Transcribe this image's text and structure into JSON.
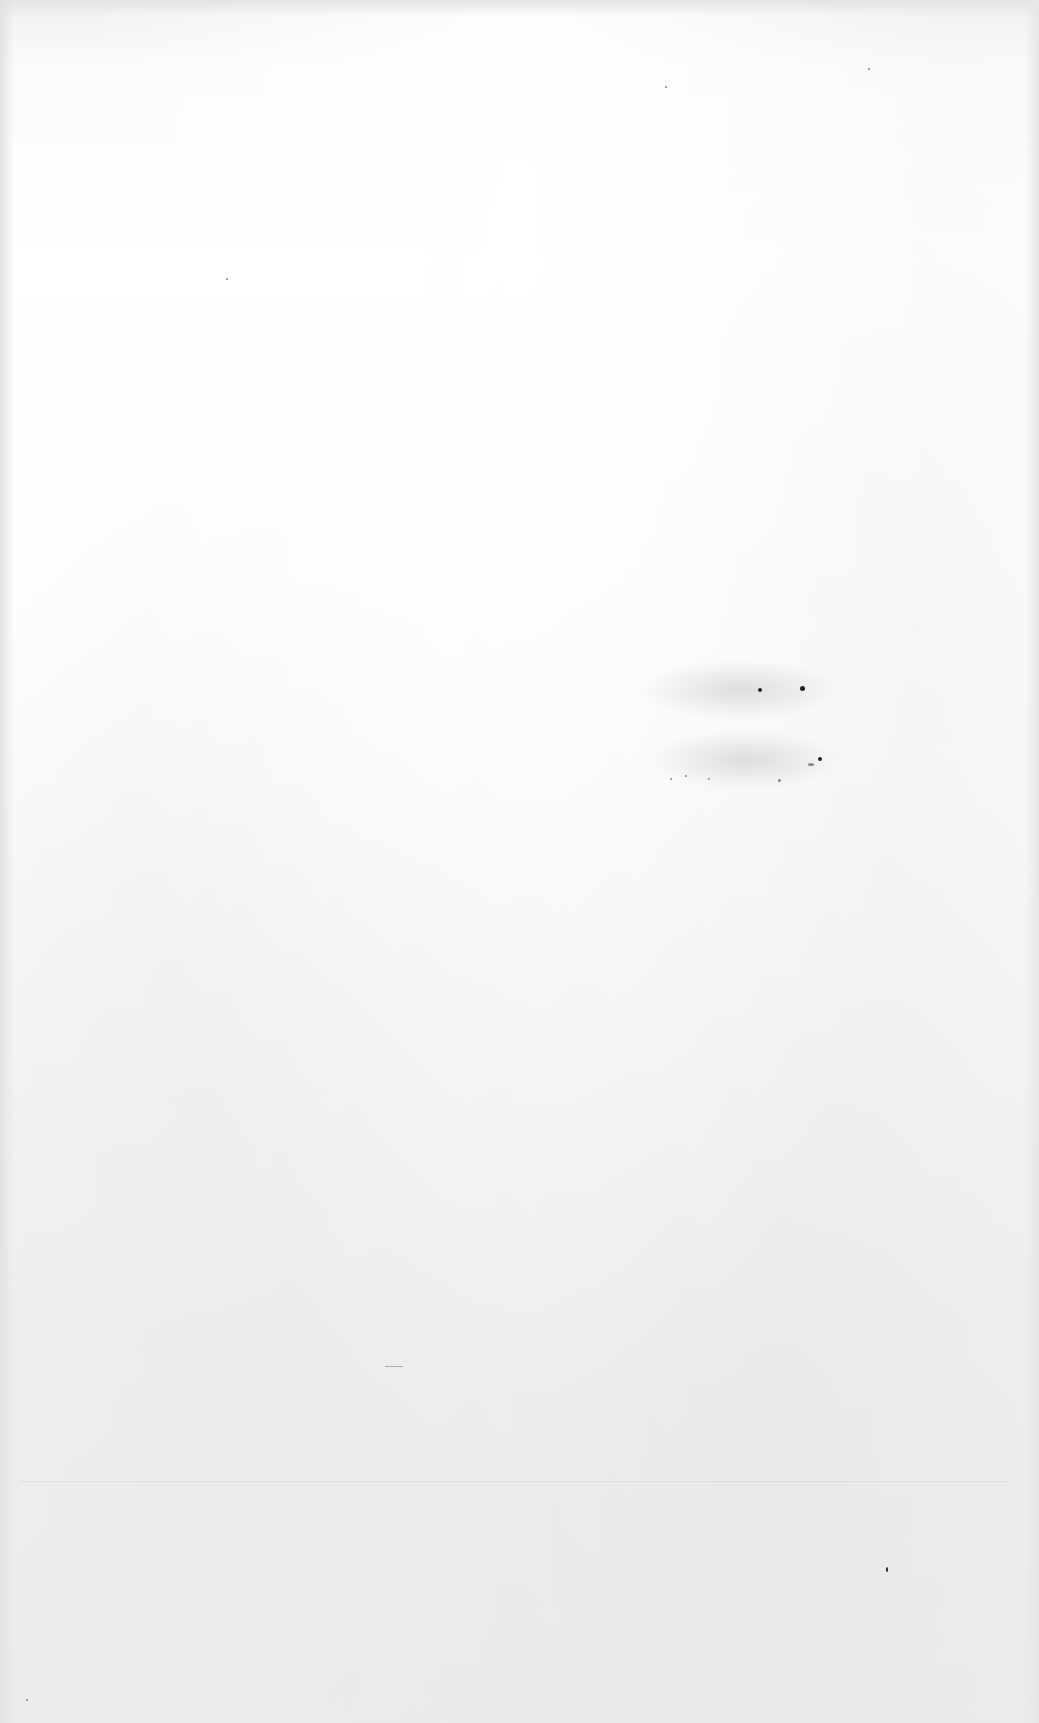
{
  "page": {
    "type": "blank-scanned-page",
    "background_color": "#ffffff",
    "visible_text": []
  }
}
